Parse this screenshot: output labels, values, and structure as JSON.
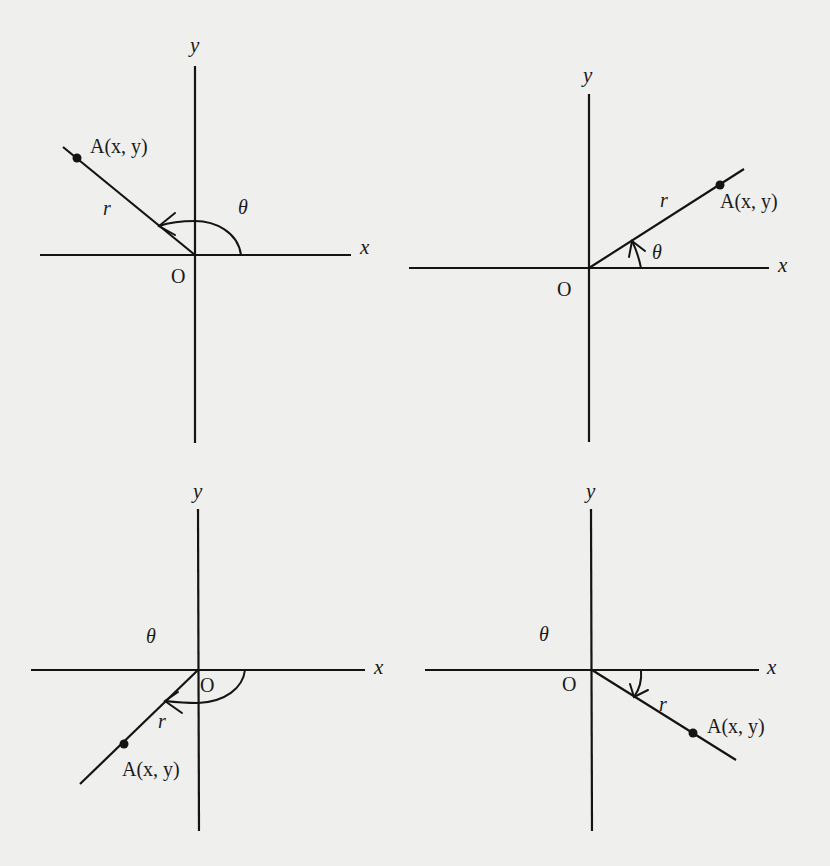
{
  "figure": {
    "colors": {
      "background": "#efefed",
      "ink": "#141414"
    },
    "panels": [
      {
        "id": "panel-1",
        "quadrant": "II",
        "angle_direction": "counterclockwise",
        "labels": {
          "x_axis": "x",
          "y_axis": "y",
          "origin": "O",
          "radius": "r",
          "angle": "θ",
          "point": "A(x, y)"
        }
      },
      {
        "id": "panel-2",
        "quadrant": "I",
        "angle_direction": "counterclockwise",
        "labels": {
          "x_axis": "x",
          "y_axis": "y",
          "origin": "O",
          "radius": "r",
          "angle": "θ",
          "point": "A(x, y)"
        }
      },
      {
        "id": "panel-3",
        "quadrant": "III",
        "angle_direction": "clockwise",
        "labels": {
          "x_axis": "x",
          "y_axis": "y",
          "origin": "O",
          "radius": "r",
          "angle": "θ",
          "point": "A(x, y)"
        }
      },
      {
        "id": "panel-4",
        "quadrant": "IV",
        "angle_direction": "clockwise",
        "labels": {
          "x_axis": "x",
          "y_axis": "y",
          "origin": "O",
          "radius": "r",
          "angle": "θ",
          "point": "A(x, y)"
        }
      }
    ]
  }
}
